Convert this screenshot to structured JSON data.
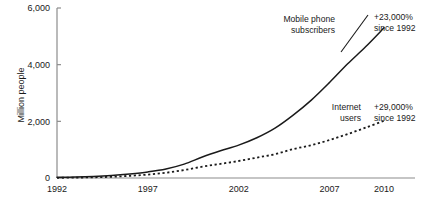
{
  "chart_data": {
    "type": "line",
    "title": "",
    "subtitle": "",
    "xlabel": "",
    "ylabel": "Million people",
    "xlim": [
      1992,
      2010
    ],
    "ylim": [
      0,
      6000
    ],
    "grid": false,
    "legend_position": "inline-annotations",
    "x_tick_labels": [
      "1992",
      "1997",
      "2002",
      "2007",
      "2010"
    ],
    "x_tick_values": [
      1992,
      1997,
      2002,
      2007,
      2010
    ],
    "y_tick_labels": [
      "0",
      "2,000",
      "4,000",
      "6,000"
    ],
    "y_tick_values": [
      0,
      2000,
      4000,
      6000
    ],
    "x": [
      1992,
      1993,
      1994,
      1995,
      1996,
      1997,
      1998,
      1999,
      2000,
      2001,
      2002,
      2003,
      2004,
      2005,
      2006,
      2007,
      2008,
      2009,
      2010
    ],
    "series": [
      {
        "name": "Mobile phone subscribers",
        "style": "solid",
        "label": "Mobile phone subscribers",
        "label_line1": "Mobile phone",
        "label_line2": "subscribers",
        "annotation_line1": "+23,000%",
        "annotation_line2": "since 1992",
        "values": [
          23,
          34,
          55,
          91,
          145,
          215,
          318,
          490,
          740,
          960,
          1160,
          1420,
          1760,
          2220,
          2750,
          3370,
          4030,
          4640,
          5300
        ]
      },
      {
        "name": "Internet users",
        "style": "dashed",
        "label": "Internet users",
        "label_line1": "Internet",
        "label_line2": "users",
        "annotation_line1": "+29,000%",
        "annotation_line2": "since 1992",
        "values": [
          7,
          14,
          25,
          44,
          77,
          120,
          188,
          280,
          400,
          500,
          600,
          720,
          840,
          1020,
          1160,
          1340,
          1550,
          1780,
          2020
        ]
      }
    ]
  },
  "colors": {
    "axis": "#8c8c8c",
    "series": "#1a1a1a",
    "background": "#ffffff"
  }
}
